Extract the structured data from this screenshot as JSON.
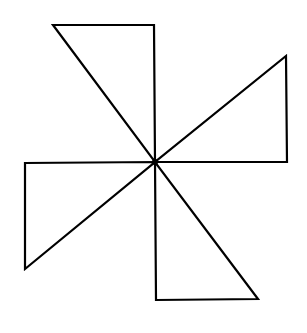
{
  "diagram": {
    "stroke_color": "#000000",
    "background_color": "#ffffff",
    "stroke_width": 2.2,
    "center": [
      155,
      162
    ],
    "triangles": [
      {
        "name": "top-triangle",
        "points": [
          [
            53,
            25
          ],
          [
            154,
            25
          ],
          [
            155,
            162
          ]
        ]
      },
      {
        "name": "right-triangle",
        "points": [
          [
            286,
            56
          ],
          [
            287,
            162
          ],
          [
            155,
            162
          ]
        ]
      },
      {
        "name": "bottom-triangle",
        "points": [
          [
            156,
            300
          ],
          [
            258,
            299
          ],
          [
            155,
            162
          ]
        ]
      },
      {
        "name": "left-triangle",
        "points": [
          [
            25,
            163
          ],
          [
            25,
            269
          ],
          [
            155,
            162
          ]
        ]
      }
    ]
  }
}
